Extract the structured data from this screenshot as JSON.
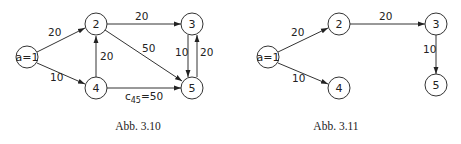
{
  "figures": [
    {
      "caption": "Abb. 3.10",
      "nodes": [
        {
          "id": "1",
          "label": "a=1",
          "x": 27,
          "y": 57
        },
        {
          "id": "2",
          "label": "2",
          "x": 96,
          "y": 24
        },
        {
          "id": "3",
          "label": "3",
          "x": 192,
          "y": 24
        },
        {
          "id": "4",
          "label": "4",
          "x": 96,
          "y": 88
        },
        {
          "id": "5",
          "label": "5",
          "x": 192,
          "y": 88
        }
      ],
      "edges": [
        {
          "from": "1",
          "to": "2",
          "weight": "20"
        },
        {
          "from": "1",
          "to": "4",
          "weight": "10"
        },
        {
          "from": "4",
          "to": "2",
          "weight": "20"
        },
        {
          "from": "2",
          "to": "3",
          "weight": "20"
        },
        {
          "from": "2",
          "to": "5",
          "weight": "50"
        },
        {
          "from": "3",
          "to": "5",
          "weight": "10"
        },
        {
          "from": "5",
          "to": "3",
          "weight": "20"
        },
        {
          "from": "4",
          "to": "5",
          "weight": "c45=50"
        }
      ]
    },
    {
      "caption": "Abb. 3.11",
      "nodes": [
        {
          "id": "1",
          "label": "a=1",
          "x": 268,
          "y": 57
        },
        {
          "id": "2",
          "label": "2",
          "x": 339,
          "y": 24
        },
        {
          "id": "3",
          "label": "3",
          "x": 436,
          "y": 24
        },
        {
          "id": "4",
          "label": "4",
          "x": 339,
          "y": 88
        },
        {
          "id": "5",
          "label": "5",
          "x": 436,
          "y": 85
        }
      ],
      "edges": [
        {
          "from": "1",
          "to": "2",
          "weight": "20"
        },
        {
          "from": "1",
          "to": "4",
          "weight": "10"
        },
        {
          "from": "2",
          "to": "3",
          "weight": "20"
        },
        {
          "from": "3",
          "to": "5",
          "weight": "10"
        }
      ]
    }
  ]
}
